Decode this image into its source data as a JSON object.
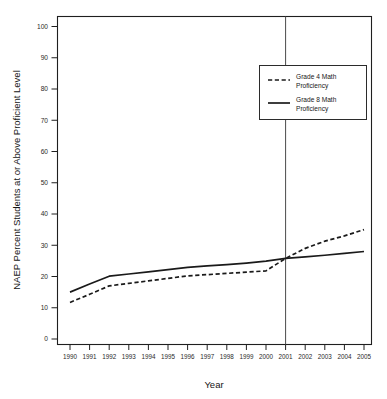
{
  "chart_data": {
    "type": "line",
    "title": "",
    "xlabel": "Year",
    "ylabel": "NAEP Percent Students at or Above Proficient Level",
    "x": [
      1990,
      1991,
      1992,
      1993,
      1994,
      1995,
      1996,
      1997,
      1998,
      1999,
      2000,
      2001,
      2002,
      2003,
      2004,
      2005
    ],
    "categories": [
      "1990",
      "1991",
      "1992",
      "1993",
      "1994",
      "1995",
      "1996",
      "1997",
      "1998",
      "1999",
      "2000",
      "2001",
      "2002",
      "2003",
      "2004",
      "2005"
    ],
    "xlim": [
      1990,
      2005
    ],
    "ylim": [
      0,
      100
    ],
    "yticks": [
      0,
      10,
      20,
      30,
      40,
      50,
      60,
      70,
      80,
      90,
      100
    ],
    "ytick_labels": [
      "0",
      "10",
      "20",
      "30",
      "40",
      "50",
      "60",
      "70",
      "80",
      "90",
      "100"
    ],
    "grid": false,
    "legend_position": "upper right",
    "series": [
      {
        "name": "Grade 4 Math Proficiency",
        "style": "dashed",
        "color": "#1a1a1a",
        "values": [
          11.7,
          14.3,
          17.0,
          17.8,
          18.6,
          19.4,
          20.2,
          20.6,
          21.0,
          21.4,
          21.8,
          25.8,
          29.0,
          31.3,
          33.0,
          35.0
        ]
      },
      {
        "name": "Grade 8 Math Proficiency",
        "style": "solid",
        "color": "#1a1a1a",
        "values": [
          15.0,
          17.6,
          20.1,
          20.8,
          21.5,
          22.2,
          22.9,
          23.4,
          23.8,
          24.3,
          24.9,
          25.8,
          26.3,
          26.8,
          27.4,
          28.0
        ]
      }
    ],
    "annotations": [
      {
        "type": "vertical-line",
        "x": 2001,
        "label": ""
      }
    ],
    "legend_entries": [
      {
        "label_line1": "Grade 4 Math",
        "label_line2": "Proficiency",
        "style": "dashed"
      },
      {
        "label_line1": "Grade 8 Math",
        "label_line2": "Proficiency",
        "style": "solid"
      }
    ]
  }
}
